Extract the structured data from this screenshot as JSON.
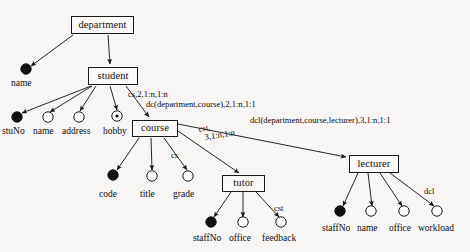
{
  "diagram": {
    "colors": {
      "background": "#f7f6f4",
      "stroke": "#191919",
      "key_attribute_fill": "#111111",
      "plain_attribute_fill": "#ffffff",
      "text": "#101010"
    },
    "entities": [
      {
        "id": "department",
        "label": "department",
        "x": 71,
        "y": 16,
        "w": 63,
        "h": 18
      },
      {
        "id": "student",
        "label": "student",
        "x": 88,
        "y": 67,
        "w": 50,
        "h": 18
      },
      {
        "id": "course",
        "label": "course",
        "x": 132,
        "y": 120,
        "w": 46,
        "h": 17
      },
      {
        "id": "tutor",
        "label": "tutor",
        "x": 222,
        "y": 175,
        "w": 43,
        "h": 17
      },
      {
        "id": "lecturer",
        "label": "lecturer",
        "x": 349,
        "y": 155,
        "w": 50,
        "h": 18
      }
    ],
    "attributes": [
      {
        "id": "dept-name",
        "label": "name",
        "owner": "department",
        "kind": "key",
        "cx": 26,
        "cy": 69,
        "label_x": 11,
        "label_y": 79
      },
      {
        "id": "student-stuno",
        "label": "stuNo",
        "owner": "student",
        "kind": "key",
        "cx": 17,
        "cy": 117,
        "label_x": 2,
        "label_y": 127
      },
      {
        "id": "student-name",
        "label": "name",
        "owner": "student",
        "kind": "plain",
        "cx": 48,
        "cy": 117,
        "label_x": 33,
        "label_y": 127
      },
      {
        "id": "student-address",
        "label": "address",
        "owner": "student",
        "kind": "plain",
        "cx": 79,
        "cy": 117,
        "label_x": 62,
        "label_y": 127
      },
      {
        "id": "student-hobby",
        "label": "hobby",
        "owner": "student",
        "kind": "multivalue",
        "cx": 117,
        "cy": 116,
        "label_x": 103,
        "label_y": 127
      },
      {
        "id": "course-code",
        "label": "code",
        "owner": "course",
        "kind": "key",
        "cx": 113,
        "cy": 175,
        "label_x": 99,
        "label_y": 190
      },
      {
        "id": "course-title",
        "label": "title",
        "owner": "course",
        "kind": "plain",
        "cx": 152,
        "cy": 176,
        "label_x": 140,
        "label_y": 190
      },
      {
        "id": "course-grade",
        "label": "grade",
        "owner": "course",
        "kind": "plain",
        "cx": 188,
        "cy": 176,
        "label_x": 173,
        "label_y": 190
      },
      {
        "id": "tutor-staffno",
        "label": "staffNo",
        "owner": "tutor",
        "kind": "key",
        "cx": 211,
        "cy": 222,
        "label_x": 193,
        "label_y": 234
      },
      {
        "id": "tutor-office",
        "label": "office",
        "owner": "tutor",
        "kind": "plain",
        "cx": 243,
        "cy": 222,
        "label_x": 229,
        "label_y": 234
      },
      {
        "id": "tutor-feedback",
        "label": "feedback",
        "owner": "tutor",
        "kind": "plain",
        "cx": 281,
        "cy": 222,
        "label_x": 262,
        "label_y": 234
      },
      {
        "id": "lect-staffno",
        "label": "staffNo",
        "owner": "lecturer",
        "kind": "key",
        "cx": 340,
        "cy": 211,
        "label_x": 322,
        "label_y": 224
      },
      {
        "id": "lect-name",
        "label": "name",
        "owner": "lecturer",
        "kind": "plain",
        "cx": 371,
        "cy": 211,
        "label_x": 357,
        "label_y": 224
      },
      {
        "id": "lect-office",
        "label": "office",
        "owner": "lecturer",
        "kind": "plain",
        "cx": 404,
        "cy": 211,
        "label_x": 389,
        "label_y": 224
      },
      {
        "id": "lect-workload",
        "label": "workload",
        "owner": "lecturer",
        "kind": "plain",
        "cx": 437,
        "cy": 211,
        "label_x": 418,
        "label_y": 224
      }
    ],
    "edge_labels": [
      {
        "id": "cs-grade",
        "text": "cs",
        "x": 171,
        "y": 151
      },
      {
        "id": "cst-feedback",
        "text": "cst",
        "x": 274,
        "y": 204
      },
      {
        "id": "dcl-workload",
        "text": "dcl",
        "x": 424,
        "y": 187
      }
    ],
    "relationship_labels": [
      {
        "id": "cs-rel",
        "line1": "cs,2,1:n,1:n",
        "x": 128,
        "y": 90
      },
      {
        "id": "dc-rel",
        "line1": "dc(department,course),2,1:n,1:1",
        "x": 146,
        "y": 100
      },
      {
        "id": "cst-rel-a",
        "line1": "cst,",
        "x": 198,
        "y": 125,
        "rotate": -9
      },
      {
        "id": "cst-rel-b",
        "line1": "3,1:n,1:n",
        "x": 204,
        "y": 133,
        "rotate": -9
      },
      {
        "id": "dcl-rel",
        "line1": "dcl(department,course,lecturer),3,1:n,1:1",
        "x": 250,
        "y": 116
      }
    ]
  }
}
